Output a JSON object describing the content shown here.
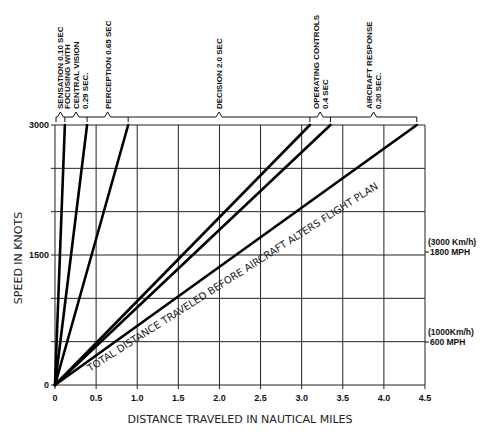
{
  "chart_data": {
    "type": "line",
    "title": "",
    "xlabel": "DISTANCE TRAVELED IN NAUTICAL MILES",
    "ylabel": "SPEED IN KNOTS",
    "xlim": [
      0,
      4.5
    ],
    "ylim": [
      0,
      3000
    ],
    "x_ticks": [
      "0",
      "0.5",
      "1.0",
      "1.5",
      "2.0",
      "2.5",
      "3.0",
      "3.5",
      "4.0",
      "4.5"
    ],
    "x_tick_values": [
      0,
      0.5,
      1.0,
      1.5,
      2.0,
      2.5,
      3.0,
      3.5,
      4.0,
      4.5
    ],
    "y_ticks": [
      "0",
      "1500",
      "3000"
    ],
    "y_tick_values": [
      0,
      1500,
      3000
    ],
    "y_grid_values": [
      0,
      500,
      1000,
      1500,
      2000,
      2500,
      3000
    ],
    "grid": true,
    "legend": "none",
    "series": [
      {
        "name": "Sensation",
        "x": [
          0,
          0.12
        ],
        "y": [
          0,
          3000
        ]
      },
      {
        "name": "Focusing with central vision",
        "x": [
          0,
          0.39
        ],
        "y": [
          0,
          3000
        ]
      },
      {
        "name": "Perception",
        "x": [
          0,
          0.89
        ],
        "y": [
          0,
          3000
        ]
      },
      {
        "name": "Decision",
        "x": [
          0,
          3.1
        ],
        "y": [
          0,
          3000
        ]
      },
      {
        "name": "Operating controls",
        "x": [
          0,
          3.35
        ],
        "y": [
          0,
          3000
        ]
      },
      {
        "name": "Aircraft response (total)",
        "x": [
          0,
          4.4
        ],
        "y": [
          0,
          3000
        ]
      }
    ],
    "stage_labels": [
      {
        "line1": "SENSATION 0.10 SEC"
      },
      {
        "line1": "FOCUSING WITH",
        "line2": "CENTRAL VISION",
        "line3": "0.29 SEC."
      },
      {
        "line1": "PERCEPTION 0.65 SEC"
      },
      {
        "line1": "DECISION 2.0 SEC"
      },
      {
        "line1": "OPERATING CONTROLS",
        "line2": "0.4 SEC"
      },
      {
        "line1": "AIRCRAFT RESPONSE",
        "line2": "0.20 SEC."
      }
    ],
    "annotations": {
      "diagonal": "TOTAL DISTANCE TRAVELED BEFORE AIRCRAFT ALTERS FLIGHT PLAN",
      "conv_high_1": "(3000 Km/h)",
      "conv_high_2": "1800 MPH",
      "conv_low_1": "(1000Km/h)",
      "conv_low_2": "600 MPH"
    }
  }
}
